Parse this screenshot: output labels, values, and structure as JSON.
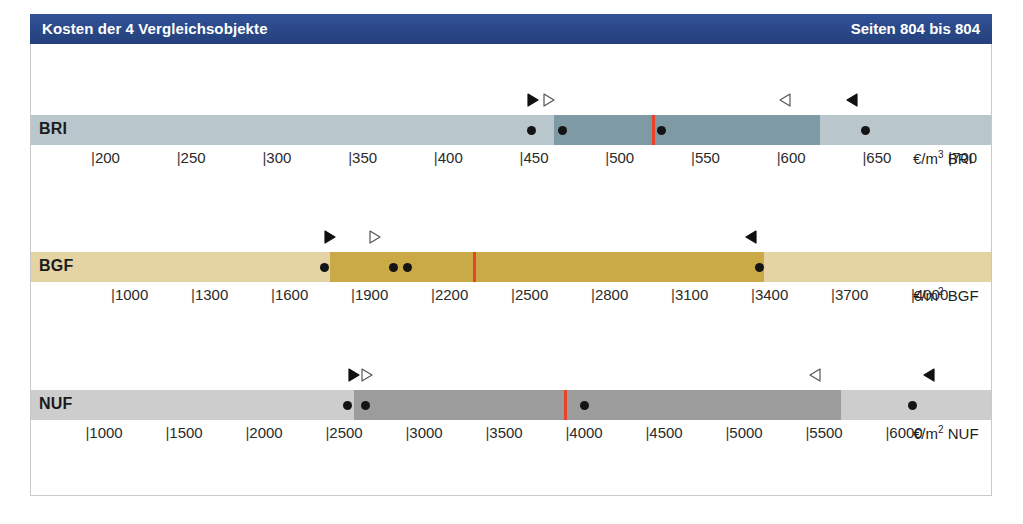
{
  "header": {
    "title": "Kosten der 4 Vergleichsobjekte",
    "pages": "Seiten 804 bis 804",
    "bar_color": "#2a4887",
    "text_color": "#ffffff"
  },
  "legend_markers": {
    "filled_right": "▶",
    "hollow_right": "▷",
    "filled_left": "◀",
    "hollow_left": "◁",
    "point": "●",
    "median_line_color": "#e8442a"
  },
  "chart_data": {
    "type": "bar",
    "title": "Kosten der 4 Vergleichsobjekte",
    "rows": [
      {
        "key": "BRI",
        "label": "BRI",
        "unit": "€/m³ BRI",
        "unit_prefix": "€/m",
        "unit_sup": "3",
        "unit_suffix": " BRI",
        "base_color": "#b9c6cc",
        "dark_color": "#7e9aa4",
        "axis_min": 165,
        "axis_max": 725,
        "ticks": [
          200,
          250,
          300,
          350,
          400,
          450,
          500,
          550,
          600,
          650,
          700
        ],
        "tick_labels": [
          "200",
          "250",
          "300",
          "350",
          "400",
          "450",
          "500",
          "550",
          "600",
          "650",
          "700"
        ],
        "dark_band": [
          470,
          625
        ],
        "median": 528,
        "points": [
          457,
          475,
          533,
          652
        ],
        "markers": [
          {
            "type": "filled_right",
            "value": 458
          },
          {
            "type": "hollow_right",
            "value": 467
          },
          {
            "type": "hollow_left",
            "value": 605
          },
          {
            "type": "filled_left",
            "value": 644
          }
        ]
      },
      {
        "key": "BGF",
        "label": "BGF",
        "unit": "€/m² BGF",
        "unit_prefix": "€/m",
        "unit_sup": "2",
        "unit_suffix": " BGF",
        "base_color": "#e4d4a4",
        "dark_color": "#c9aa47",
        "axis_min": 700,
        "axis_max": 4300,
        "ticks": [
          1000,
          1300,
          1600,
          1900,
          2200,
          2500,
          2800,
          3100,
          3400,
          3700,
          4000
        ],
        "tick_labels": [
          "1000",
          "1300",
          "1600",
          "1900",
          "2200",
          "2500",
          "2800",
          "3100",
          "3400",
          "3700",
          "4000"
        ],
        "dark_band": [
          1820,
          3450
        ],
        "median": 2360,
        "points": [
          1800,
          2060,
          2110,
          3430
        ],
        "markers": [
          {
            "type": "filled_right",
            "value": 1820
          },
          {
            "type": "hollow_right",
            "value": 1990
          },
          {
            "type": "filled_left",
            "value": 3400
          }
        ]
      },
      {
        "key": "NUF",
        "label": "NUF",
        "unit": "€/m² NUF",
        "unit_prefix": "€/m",
        "unit_sup": "2",
        "unit_suffix": " NUF",
        "base_color": "#cdcdcd",
        "dark_color": "#9c9c9c",
        "axis_min": 660,
        "axis_max": 6660,
        "ticks": [
          1000,
          1500,
          2000,
          2500,
          3000,
          3500,
          4000,
          4500,
          5000,
          5500,
          6000
        ],
        "tick_labels": [
          "1000",
          "1500",
          "2000",
          "2500",
          "3000",
          "3500",
          "4000",
          "4500",
          "5000",
          "5500",
          "6000"
        ],
        "dark_band": [
          2680,
          5720
        ],
        "median": 4000,
        "points": [
          2640,
          2750,
          4120,
          6170
        ],
        "markers": [
          {
            "type": "filled_right",
            "value": 2680
          },
          {
            "type": "hollow_right",
            "value": 2760
          },
          {
            "type": "hollow_left",
            "value": 5560
          },
          {
            "type": "filled_left",
            "value": 6270
          }
        ]
      }
    ]
  }
}
